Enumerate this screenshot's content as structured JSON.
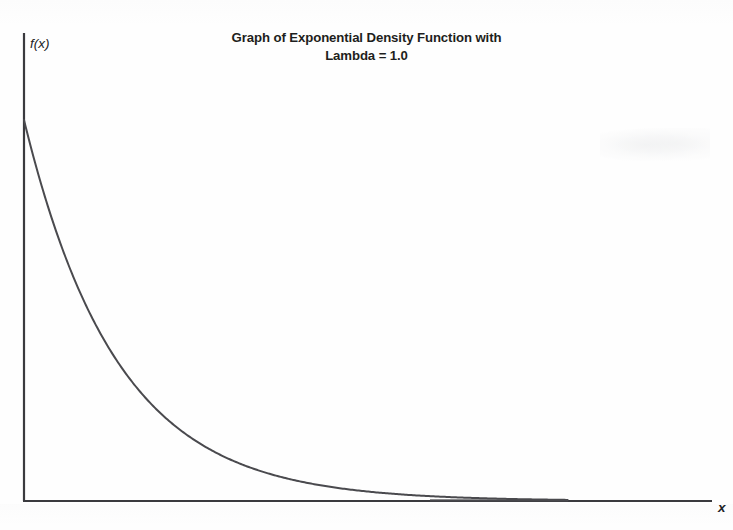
{
  "figure": {
    "width": 733,
    "height": 530,
    "background_color": "#fefefe",
    "title_line_1": "Graph of Exponential Density Function with",
    "title_line_2": "Lambda = 1.0",
    "title_full": "Graph of Exponential Density Function with\nLambda = 1.0",
    "x_axis_label": "x",
    "y_axis_label": "f(x)"
  },
  "chart_data": {
    "type": "line",
    "title": "Graph of Exponential Density Function with Lambda = 1.0",
    "xlabel": "x",
    "ylabel": "f(x)",
    "grid": false,
    "legend": "none",
    "axis_style": "open-corner L-shaped axes, no tick marks, no tick labels",
    "curve_color": "#4a4a4e",
    "axis_color": "#3a3a3e",
    "function": "f(x) = lambda * exp(-lambda * x)",
    "parameters": {
      "lambda": 1.0
    },
    "xlim": [
      0,
      7.2
    ],
    "ylim": [
      0,
      1.05
    ],
    "series": [
      {
        "name": "Exponential density, lambda = 1.0",
        "x": [
          0.0,
          0.1,
          0.2,
          0.3,
          0.4,
          0.5,
          0.6,
          0.7,
          0.8,
          0.9,
          1.0,
          1.2,
          1.4,
          1.6,
          1.8,
          2.0,
          2.2,
          2.4,
          2.6,
          2.8,
          3.0,
          3.2,
          3.4,
          3.6,
          3.8,
          4.0,
          4.5,
          5.0,
          5.5,
          6.0
        ],
        "y": [
          1.0,
          0.905,
          0.819,
          0.741,
          0.67,
          0.607,
          0.549,
          0.497,
          0.449,
          0.407,
          0.368,
          0.301,
          0.247,
          0.202,
          0.165,
          0.135,
          0.111,
          0.091,
          0.074,
          0.061,
          0.05,
          0.041,
          0.033,
          0.027,
          0.022,
          0.018,
          0.011,
          0.007,
          0.004,
          0.002
        ]
      }
    ],
    "annotations": []
  },
  "geometry": {
    "origin_x": 24,
    "origin_y": 501,
    "y_axis_top": 33,
    "x_axis_right": 712,
    "curve_start_x": 24,
    "curve_start_y": 120,
    "curve_end_x": 568,
    "pixels_per_unit_x": 93,
    "pixels_per_unit_y": 381
  }
}
